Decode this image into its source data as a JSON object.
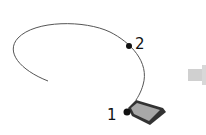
{
  "diagram": {
    "points": [
      {
        "label": "1"
      },
      {
        "label": "2"
      }
    ],
    "colors": {
      "curve": "#555555",
      "point": "#111111",
      "shape_fill": "#9a9a9a",
      "shape_stroke": "#333333",
      "arrow": "#d0d0d0"
    }
  }
}
